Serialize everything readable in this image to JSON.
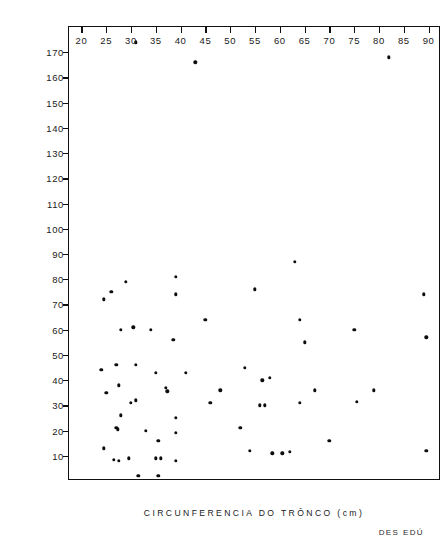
{
  "chart_data": {
    "type": "scatter",
    "title": "",
    "xlabel": "CIRCUNFERENCIA DO TRÔNCO   (cm)",
    "ylabel": "INCREMENTO 15 AÑOS   (cm)",
    "xlim": [
      17.5,
      92.5
    ],
    "ylim": [
      0,
      180
    ],
    "grid": false,
    "legend": null,
    "xticks": [
      20,
      25,
      30,
      35,
      40,
      45,
      50,
      55,
      60,
      65,
      70,
      75,
      80,
      85,
      90
    ],
    "xtick_labels": [
      "20",
      "25",
      "30",
      "35",
      "40",
      "45",
      "50",
      "55",
      "60",
      "65",
      "70",
      "75",
      "80",
      "85",
      "90"
    ],
    "yticks": [
      10,
      20,
      30,
      40,
      50,
      60,
      70,
      80,
      90,
      100,
      110,
      120,
      130,
      140,
      150,
      160,
      170
    ],
    "ytick_labels": [
      "10",
      "20",
      "30",
      "40",
      "50",
      "60",
      "70",
      "80",
      "90",
      "100",
      "110",
      "120",
      "130",
      "140",
      "150",
      "160",
      "170"
    ],
    "marker": "filled-circle",
    "marker_color": "#0d0d0d",
    "points": [
      [
        31.0,
        174.0
      ],
      [
        43.0,
        166.0
      ],
      [
        82.0,
        168.0
      ],
      [
        63.0,
        87.0
      ],
      [
        39.0,
        81.0
      ],
      [
        26.0,
        75.0
      ],
      [
        29.0,
        79.0
      ],
      [
        55.0,
        76.0
      ],
      [
        89.0,
        74.0
      ],
      [
        24.5,
        72.0
      ],
      [
        39.0,
        74.0
      ],
      [
        64.0,
        64.0
      ],
      [
        45.0,
        64.0
      ],
      [
        28.0,
        60.0
      ],
      [
        30.5,
        61.0
      ],
      [
        34.0,
        60.0
      ],
      [
        38.5,
        56.0
      ],
      [
        75.0,
        60.0
      ],
      [
        65.0,
        55.0
      ],
      [
        89.5,
        57.0
      ],
      [
        24.0,
        44.0
      ],
      [
        27.0,
        46.0
      ],
      [
        31.0,
        46.0
      ],
      [
        53.0,
        45.0
      ],
      [
        41.0,
        43.0
      ],
      [
        35.0,
        43.0
      ],
      [
        25.0,
        35.0
      ],
      [
        27.5,
        38.0
      ],
      [
        56.5,
        40.0
      ],
      [
        58.0,
        41.0
      ],
      [
        37.0,
        37.0
      ],
      [
        37.3,
        35.5
      ],
      [
        48.0,
        36.0
      ],
      [
        67.0,
        36.0
      ],
      [
        79.0,
        36.0
      ],
      [
        30.0,
        31.0
      ],
      [
        31.0,
        32.0
      ],
      [
        46.0,
        31.0
      ],
      [
        56.0,
        30.0
      ],
      [
        57.0,
        30.0
      ],
      [
        64.0,
        31.0
      ],
      [
        75.5,
        31.5
      ],
      [
        28.0,
        26.0
      ],
      [
        39.0,
        25.0
      ],
      [
        27.0,
        21.0
      ],
      [
        27.4,
        20.5
      ],
      [
        52.0,
        21.0
      ],
      [
        33.0,
        20.0
      ],
      [
        39.0,
        19.0
      ],
      [
        35.5,
        16.0
      ],
      [
        70.0,
        16.0
      ],
      [
        24.5,
        13.0
      ],
      [
        54.0,
        12.0
      ],
      [
        58.5,
        11.0
      ],
      [
        60.5,
        11.0
      ],
      [
        62.0,
        11.5
      ],
      [
        89.5,
        12.0
      ],
      [
        26.5,
        8.5
      ],
      [
        27.5,
        8.0
      ],
      [
        29.5,
        9.0
      ],
      [
        35.0,
        9.0
      ],
      [
        36.0,
        9.0
      ],
      [
        39.0,
        8.0
      ],
      [
        31.5,
        2.0
      ],
      [
        35.5,
        2.0
      ]
    ]
  },
  "annotations": {
    "credit": "DES EDÚ"
  }
}
